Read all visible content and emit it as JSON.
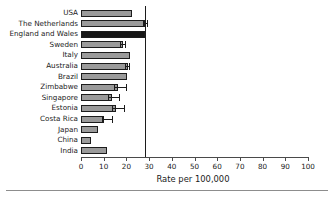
{
  "chart_data": {
    "type": "bar",
    "orientation": "horizontal",
    "title": "",
    "xlabel": "Rate per 100,000",
    "ylabel": "",
    "xlim": [
      0,
      100
    ],
    "xticks": [
      0,
      10,
      20,
      30,
      40,
      50,
      60,
      70,
      80,
      90,
      100
    ],
    "grid": false,
    "legend": null,
    "reference_line": {
      "value": 28,
      "orientation": "vertical",
      "color": "#1c1c1c"
    },
    "bar_color": "#9a9a9a",
    "highlight_color": "#161616",
    "highlight_category": "England and Wales",
    "categories": [
      "USA",
      "The Netherlands",
      "England and Wales",
      "Sweden",
      "Italy",
      "Australia",
      "Brazil",
      "Zimbabwe",
      "Singapore",
      "Estonia",
      "Costa Rica",
      "Japan",
      "China",
      "India"
    ],
    "values": [
      22.5,
      28.0,
      28.0,
      18.5,
      21.5,
      20.7,
      20.3,
      16.3,
      13.7,
      15.4,
      10.3,
      7.5,
      4.4,
      11.5
    ],
    "error_low": [
      null,
      27.2,
      null,
      17.3,
      null,
      19.6,
      null,
      14.6,
      12.0,
      13.6,
      9.2,
      null,
      null,
      null
    ],
    "error_high": [
      null,
      29.6,
      null,
      20.0,
      null,
      21.8,
      null,
      20.3,
      17.3,
      19.3,
      14.2,
      null,
      null,
      null
    ]
  }
}
